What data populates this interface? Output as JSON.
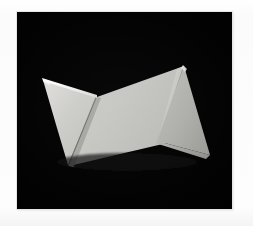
{
  "page": {
    "background_color": "#fdfdfd",
    "width": 253,
    "height": 226,
    "caption": ""
  },
  "photo": {
    "name": "folded-paper-origami-photograph",
    "alt_text": "Photograph of a folded sheet of white paper forming a zigzag bow-tie shape on a black background",
    "background_color": "#000000",
    "frame": {
      "x": 17,
      "y": 12,
      "width": 215,
      "height": 197
    },
    "subject": "folded paper sculpture",
    "lighting": "single soft key light from upper left",
    "colors": {
      "backdrop": "#000000",
      "paper_highlight": "#f2f2f0",
      "paper_light": "#d2d2cf",
      "paper_mid": "#c3c3c0",
      "paper_medium": "#b6b6b3",
      "paper_shadow": "#9c9c99",
      "paper_dark": "#7d7d7a",
      "crease_line": "#5a5a57"
    },
    "facets": [
      {
        "name": "left-wing-upper",
        "tone": "#cfcfcc",
        "label": "left wing upper facet"
      },
      {
        "name": "left-wing-lower",
        "tone": "#c0c0bd",
        "label": "left wing lower facet"
      },
      {
        "name": "center-panel",
        "tone": "#c6c6c3",
        "label": "central panel"
      },
      {
        "name": "right-wing-upper",
        "tone": "#c9c9c6",
        "label": "right wing upper facet"
      },
      {
        "name": "right-wing-lower",
        "tone": "#b2b2af",
        "label": "right wing lower facet"
      },
      {
        "name": "right-wing-tip",
        "tone": "#a6a6a3",
        "label": "right wing tip facet"
      }
    ],
    "vertices": {
      "left_apex": [
        43,
        80
      ],
      "left_top_edge_end": [
        96,
        96
      ],
      "center_valley": [
        97,
        97
      ],
      "left_bottom_point": [
        68,
        165
      ],
      "center_bottom": [
        156,
        140
      ],
      "right_peak": [
        184,
        66
      ],
      "right_tip": [
        210,
        155
      ],
      "right_notch": [
        157,
        141
      ]
    }
  }
}
